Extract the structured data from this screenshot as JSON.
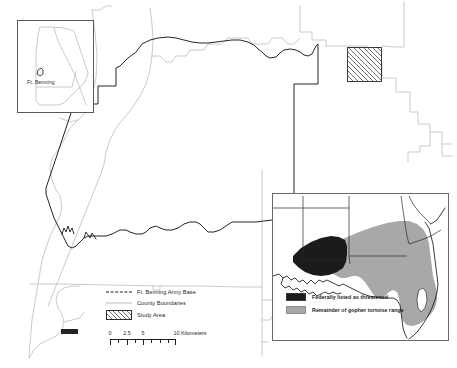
{
  "figure": {
    "kind": "map"
  },
  "locator_inset": {
    "name": "georgia-locator",
    "label": "Ft. Benning",
    "state_outline_color": "#bdbdbd",
    "frame_color": "#5a5a5a"
  },
  "study_area": {
    "name": "study-area-box",
    "fill": "hatched",
    "border_color": "#3a3a3a"
  },
  "legend": {
    "items": [
      {
        "key": "line-dashed",
        "label": "Ft. Benning Army Base",
        "color": "#1a1a1a"
      },
      {
        "key": "line-solid",
        "label": "County Boundaries",
        "color": "#b9b9b9"
      },
      {
        "key": "hatch-swatch",
        "label": "Study Area",
        "color": "#6e6e6e"
      }
    ]
  },
  "scalebar": {
    "ticks": [
      "0",
      "2.5",
      "5",
      "10"
    ],
    "units_label": "10 Kilometers",
    "tick_values": [
      0,
      2.5,
      5,
      10
    ]
  },
  "se_inset": {
    "name": "southeast-us-inset",
    "legend": [
      {
        "swatch": "black",
        "label": "Federally listed as threatened",
        "color": "#1b1b1b"
      },
      {
        "swatch": "gray",
        "label": "Remainder of gopher tortoise range",
        "color": "#a8a8a8"
      }
    ]
  },
  "colors": {
    "base_boundary": "#1a1a1a",
    "county_boundary": "#c4c4c4",
    "hatch": "#6e6e6e",
    "threatened": "#1b1b1b",
    "range": "#a8a8a8",
    "background": "#ffffff"
  }
}
